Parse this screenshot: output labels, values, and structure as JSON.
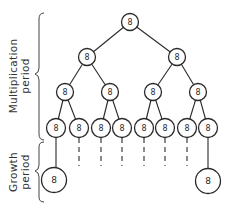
{
  "diagram": {
    "type": "binary-division-tree",
    "node_label": "8",
    "periods": [
      {
        "id": "multiplication",
        "line1": "Multiplication",
        "line2": "period"
      },
      {
        "id": "growth",
        "line1": "Growth",
        "line2": "period"
      }
    ],
    "levels": [
      {
        "level": 1,
        "count": 1
      },
      {
        "level": 2,
        "count": 2
      },
      {
        "level": 3,
        "count": 4
      },
      {
        "level": 4,
        "count": 8
      }
    ],
    "growth_nodes": [
      {
        "from_leaf": 1,
        "label": "8"
      },
      {
        "from_leaf": 8,
        "label": "8"
      }
    ],
    "dashed_continuations": [
      2,
      3,
      4,
      5,
      6,
      7
    ],
    "colors": {
      "stroke": "#2a2a2a",
      "background": "#ffffff"
    }
  },
  "labels": {
    "root": "8",
    "l2": [
      "8",
      "8"
    ],
    "l3": [
      "8",
      "8",
      "8",
      "8"
    ],
    "l4": [
      "8",
      "8",
      "8",
      "8",
      "8",
      "8",
      "8",
      "8"
    ],
    "growth": [
      "8",
      "8"
    ],
    "mult_line1": "Multiplication",
    "mult_line2": "period",
    "growth_line1": "Growth",
    "growth_line2": "period"
  }
}
